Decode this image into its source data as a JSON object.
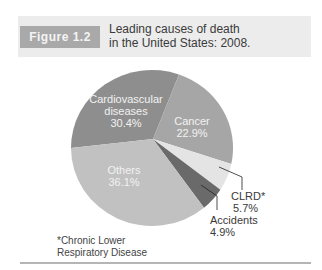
{
  "figure": {
    "label": "Figure 1.2",
    "title_line1": "Leading causes of death",
    "title_line2": "in the United States: 2008."
  },
  "footnote": {
    "line1": "*Chronic Lower",
    "line2": "Respiratory Disease"
  },
  "colors": {
    "header_band": "#ececec",
    "label_box": "#a9a9a9",
    "cardiovascular": "#8e8e8e",
    "cancer": "#a6a6a6",
    "clrd": "#e4e4e4",
    "accidents": "#6a6a6a",
    "others": "#c1c1c1"
  },
  "chart_data": {
    "type": "pie",
    "title": "Leading causes of death in the United States: 2008.",
    "categories": [
      "Cardiovascular diseases",
      "Cancer",
      "CLRD*",
      "Accidents",
      "Others"
    ],
    "values": [
      30.4,
      22.9,
      5.7,
      4.9,
      36.1
    ],
    "unit": "%",
    "labels": {
      "cardiovascular": {
        "line1": "Cardiovascular",
        "line2": "diseases",
        "value": "30.4%"
      },
      "cancer": {
        "line1": "Cancer",
        "value": "22.9%"
      },
      "clrd": {
        "line1": "CLRD*",
        "value": "5.7%"
      },
      "accidents": {
        "line1": "Accidents",
        "value": "4.9%"
      },
      "others": {
        "line1": "Others",
        "value": "36.1%"
      }
    },
    "annotations": [
      "*Chronic Lower Respiratory Disease"
    ],
    "legend": "none (direct labels)"
  }
}
